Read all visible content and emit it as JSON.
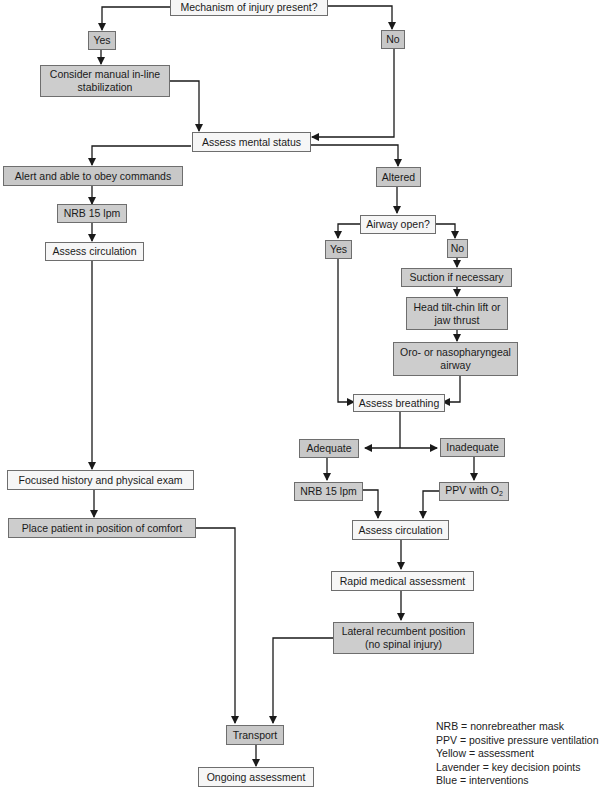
{
  "colors": {
    "assessment_fill": "#f6f6f6",
    "decision_fill": "#c8c8c8",
    "intervention_fill": "#cdcdcd",
    "line": "#1a1a1a"
  },
  "nodes": {
    "mechanism": "Mechanism of injury present?",
    "moi_yes": "Yes",
    "moi_no": "No",
    "stabilization_1": "Consider manual in-line",
    "stabilization_2": "stabilization",
    "mental_status": "Assess mental status",
    "alert": "Alert and able to obey commands",
    "altered": "Altered",
    "nrb_left": "NRB 15 lpm",
    "circ_left": "Assess circulation",
    "focused_history": "Focused history and physical exam",
    "position_comfort": "Place patient in position of comfort",
    "airway_open": "Airway open?",
    "airway_yes": "Yes",
    "airway_no": "No",
    "suction": "Suction if necessary",
    "head_tilt_1": "Head tilt-chin lift or",
    "head_tilt_2": "jaw thrust",
    "oro_1": "Oro- or nasopharyngeal",
    "oro_2": "airway",
    "breathing": "Assess breathing",
    "adequate": "Adequate",
    "inadequate": "Inadequate",
    "nrb_right": "NRB 15 lpm",
    "ppv": "PPV with O",
    "ppv_sub": "2",
    "circ_right": "Assess circulation",
    "rapid_medical": "Rapid medical assessment",
    "lateral_1": "Lateral recumbent position",
    "lateral_2": "(no spinal injury)",
    "transport": "Transport",
    "ongoing": "Ongoing assessment"
  },
  "legend": [
    "NRB = nonrebreather mask",
    "PPV = positive pressure ventilation",
    "Yellow = assessment",
    "Lavender = key decision points",
    "Blue = interventions"
  ]
}
